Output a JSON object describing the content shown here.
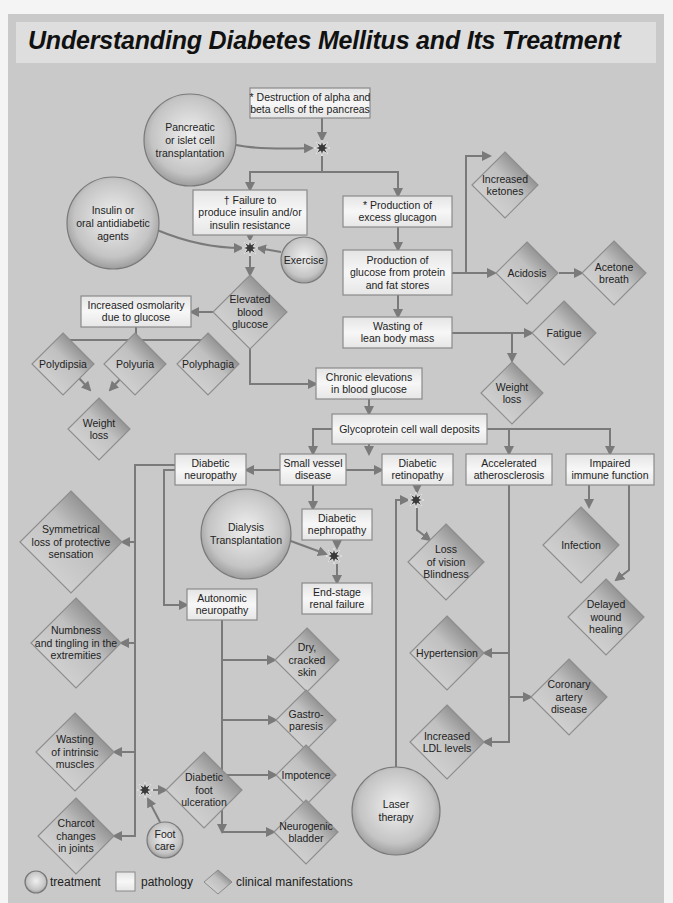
{
  "title": "Understanding Diabetes Mellitus and Its Treatment",
  "colors": {
    "panel_bg": "#c9c9c9",
    "title_bg": "#dedede",
    "box_fill": "#f2f2f2",
    "box_stroke": "#8a8a8a",
    "edge": "#7a7a7a",
    "diamond_dark": "#6a6a6a",
    "diamond_light": "#d8d8d8",
    "circle_light": "#ececec",
    "circle_dark": "#9a9a9a",
    "star": "#3a3a3a"
  },
  "legend": {
    "treatment": "treatment",
    "pathology": "pathology",
    "clinical": "clinical manifestations"
  },
  "treatments": [
    {
      "id": "t1",
      "lines": [
        "Pancreatic",
        "or islet cell",
        "transplantation"
      ],
      "cx": 190,
      "cy": 140,
      "r": 46
    },
    {
      "id": "t2",
      "lines": [
        "Insulin or",
        "oral antidiabetic",
        "agents"
      ],
      "cx": 113,
      "cy": 223,
      "r": 46
    },
    {
      "id": "t3",
      "lines": [
        "Exercise"
      ],
      "cx": 304,
      "cy": 260,
      "r": 23
    },
    {
      "id": "t4",
      "lines": [
        "Dialysis",
        "Transplantation"
      ],
      "cx": 246,
      "cy": 534,
      "r": 45
    },
    {
      "id": "t5",
      "lines": [
        "Foot",
        "care"
      ],
      "cx": 165,
      "cy": 840,
      "r": 18
    },
    {
      "id": "t6",
      "lines": [
        "Laser",
        "therapy"
      ],
      "cx": 396,
      "cy": 811,
      "r": 44
    }
  ],
  "pathologies": [
    {
      "id": "p1",
      "lines": [
        "* Destruction of alpha and",
        "beta cells of the pancreas"
      ],
      "x": 250,
      "y": 88,
      "w": 120,
      "h": 30
    },
    {
      "id": "p2",
      "lines": [
        "† Failure to",
        "produce insulin and/or",
        "insulin resistance"
      ],
      "x": 193,
      "y": 190,
      "w": 114,
      "h": 45
    },
    {
      "id": "p3",
      "lines": [
        "* Production of",
        "excess glucagon"
      ],
      "x": 343,
      "y": 196,
      "w": 109,
      "h": 31
    },
    {
      "id": "p4",
      "lines": [
        "Production of",
        "glucose from protein",
        "and fat stores"
      ],
      "x": 343,
      "y": 250,
      "w": 109,
      "h": 45
    },
    {
      "id": "p5",
      "lines": [
        "Wasting of",
        "lean body mass"
      ],
      "x": 343,
      "y": 317,
      "w": 109,
      "h": 31
    },
    {
      "id": "p6",
      "lines": [
        "Increased osmolarity",
        "due to glucose"
      ],
      "x": 81,
      "y": 296,
      "w": 110,
      "h": 31
    },
    {
      "id": "p7",
      "lines": [
        "Chronic elevations",
        "in blood glucose"
      ],
      "x": 316,
      "y": 368,
      "w": 106,
      "h": 31
    },
    {
      "id": "p8",
      "lines": [
        "Glycoprotein cell wall deposits"
      ],
      "x": 332,
      "y": 414,
      "w": 155,
      "h": 30
    },
    {
      "id": "p9",
      "lines": [
        "Diabetic",
        "neuropathy"
      ],
      "x": 175,
      "y": 454,
      "w": 71,
      "h": 31
    },
    {
      "id": "p10",
      "lines": [
        "Small vessel",
        "disease"
      ],
      "x": 280,
      "y": 454,
      "w": 66,
      "h": 31
    },
    {
      "id": "p11",
      "lines": [
        "Diabetic",
        "retinopathy"
      ],
      "x": 382,
      "y": 454,
      "w": 71,
      "h": 31
    },
    {
      "id": "p12",
      "lines": [
        "Accelerated",
        "atherosclerosis"
      ],
      "x": 466,
      "y": 454,
      "w": 86,
      "h": 31
    },
    {
      "id": "p13",
      "lines": [
        "Impaired",
        "immune function"
      ],
      "x": 566,
      "y": 454,
      "w": 88,
      "h": 31
    },
    {
      "id": "p14",
      "lines": [
        "Diabetic",
        "nephropathy"
      ],
      "x": 302,
      "y": 509,
      "w": 70,
      "h": 31
    },
    {
      "id": "p15",
      "lines": [
        "End-stage",
        "renal failure"
      ],
      "x": 302,
      "y": 583,
      "w": 70,
      "h": 31
    },
    {
      "id": "p16",
      "lines": [
        "Autonomic",
        "neuropathy"
      ],
      "x": 187,
      "y": 589,
      "w": 70,
      "h": 31
    }
  ],
  "manifestations": [
    {
      "id": "m1",
      "lines": [
        "Increased",
        "ketones"
      ],
      "cx": 505,
      "cy": 185,
      "s": 33
    },
    {
      "id": "m2",
      "lines": [
        "Acidosis"
      ],
      "cx": 527,
      "cy": 273,
      "s": 31
    },
    {
      "id": "m3",
      "lines": [
        "Acetone",
        "breath"
      ],
      "cx": 614,
      "cy": 273,
      "s": 32
    },
    {
      "id": "m4",
      "lines": [
        "Fatigue"
      ],
      "cx": 564,
      "cy": 333,
      "s": 32
    },
    {
      "id": "m5",
      "lines": [
        "Weight",
        "loss"
      ],
      "cx": 512,
      "cy": 393,
      "s": 31
    },
    {
      "id": "m6",
      "lines": [
        "Elevated",
        "blood",
        "glucose"
      ],
      "cx": 250,
      "cy": 312,
      "s": 37
    },
    {
      "id": "m7",
      "lines": [
        "Polydipsia"
      ],
      "cx": 63,
      "cy": 364,
      "s": 31
    },
    {
      "id": "m8",
      "lines": [
        "Polyuria"
      ],
      "cx": 135,
      "cy": 364,
      "s": 31
    },
    {
      "id": "m9",
      "lines": [
        "Polyphagia"
      ],
      "cx": 208,
      "cy": 364,
      "s": 31
    },
    {
      "id": "m10",
      "lines": [
        "Weight",
        "loss"
      ],
      "cx": 99,
      "cy": 429,
      "s": 31
    },
    {
      "id": "m11",
      "lines": [
        "Symmetrical",
        "loss of protective",
        "sensation"
      ],
      "cx": 71,
      "cy": 542,
      "s": 51
    },
    {
      "id": "m12",
      "lines": [
        "Numbness",
        "and tingling in the",
        "extremities"
      ],
      "cx": 76,
      "cy": 643,
      "s": 45
    },
    {
      "id": "m13",
      "lines": [
        "Loss",
        "of vision",
        "Blindness"
      ],
      "cx": 446,
      "cy": 562,
      "s": 38
    },
    {
      "id": "m14",
      "lines": [
        "Infection"
      ],
      "cx": 581,
      "cy": 545,
      "s": 38
    },
    {
      "id": "m15",
      "lines": [
        "Delayed",
        "wound",
        "healing"
      ],
      "cx": 606,
      "cy": 617,
      "s": 38
    },
    {
      "id": "m16",
      "lines": [
        "Dry,",
        "cracked",
        "skin"
      ],
      "cx": 307,
      "cy": 660,
      "s": 32
    },
    {
      "id": "m17",
      "lines": [
        "Hypertension"
      ],
      "cx": 447,
      "cy": 653,
      "s": 37
    },
    {
      "id": "m18",
      "lines": [
        "Coronary",
        "artery",
        "disease"
      ],
      "cx": 569,
      "cy": 697,
      "s": 38
    },
    {
      "id": "m19",
      "lines": [
        "Gastro-",
        "paresis"
      ],
      "cx": 306,
      "cy": 720,
      "s": 30
    },
    {
      "id": "m20",
      "lines": [
        "Increased",
        "LDL levels"
      ],
      "cx": 447,
      "cy": 742,
      "s": 37
    },
    {
      "id": "m21",
      "lines": [
        "Wasting",
        "of intrinsic",
        "muscles"
      ],
      "cx": 75,
      "cy": 752,
      "s": 39
    },
    {
      "id": "m22",
      "lines": [
        "Diabetic",
        "foot",
        "ulceration"
      ],
      "cx": 204,
      "cy": 790,
      "s": 38
    },
    {
      "id": "m23",
      "lines": [
        "Impotence"
      ],
      "cx": 306,
      "cy": 775,
      "s": 30
    },
    {
      "id": "m24",
      "lines": [
        "Charcot",
        "changes",
        "in joints"
      ],
      "cx": 76,
      "cy": 836,
      "s": 38
    },
    {
      "id": "m25",
      "lines": [
        "Neurogenic",
        "bladder"
      ],
      "cx": 306,
      "cy": 832,
      "s": 32
    }
  ],
  "stars": [
    {
      "id": "s1",
      "cx": 322,
      "cy": 148
    },
    {
      "id": "s2",
      "cx": 250,
      "cy": 248
    },
    {
      "id": "s3",
      "cx": 334,
      "cy": 556
    },
    {
      "id": "s4",
      "cx": 416,
      "cy": 500
    },
    {
      "id": "s5",
      "cx": 145,
      "cy": 790
    }
  ],
  "edges": [
    "M322 118 L322 140",
    "M236 145 Q260 150 312 148",
    "M322 156 L322 172 L250 172 L250 190",
    "M322 172 L398 172 L398 196",
    "M398 227 L398 250",
    "M398 295 L398 317",
    "M452 273 L466 273 L466 156 L490 156",
    "M466 273 L495 273",
    "M559 273 L582 273",
    "M452 333 L532 333",
    "M512 333 L512 361",
    "M250 235 L250 240",
    "M157 230 Q200 248 242 248",
    "M281 252 L258 248",
    "M250 256 L250 275",
    "M213 312 L191 312",
    "M136 327 L136 340 L63 340 L63 350",
    "M136 340 L136 350",
    "M136 340 L208 340 L208 350",
    "M78 377 L90 390",
    "M122 377 L110 390",
    "M250 349 L250 384 L316 384",
    "M369 399 L369 414",
    "M369 444 L369 454",
    "M332 429 L313 429 L313 454",
    "M487 429 L509 429 L509 454",
    "M509 429 L610 429 L610 454",
    "M280 470 L246 470",
    "M346 470 L382 470",
    "M313 485 L313 509",
    "M337 540 L337 548",
    "M288 540 L326 554",
    "M337 564 L337 583",
    "M417 485 L417 492",
    "M417 508 L417 530 L430 540",
    "M396 767 L396 500 L408 500",
    "M175 465 L135 465 L135 836 L114 836",
    "M135 542 L122 542",
    "M135 643 L121 643",
    "M135 752 L114 752",
    "M182 470 L164 470 L164 605 L187 605",
    "M222 620 L222 832",
    "M222 660 L275 660",
    "M222 720 L276 720",
    "M222 775 L276 775",
    "M222 832 L274 832",
    "M153 790 L166 790",
    "M160 822 L148 799",
    "M509 485 L509 742 L484 742",
    "M509 653 L484 653",
    "M509 697 L531 697",
    "M589 485 L589 507",
    "M629 485 L629 570 L616 580"
  ]
}
